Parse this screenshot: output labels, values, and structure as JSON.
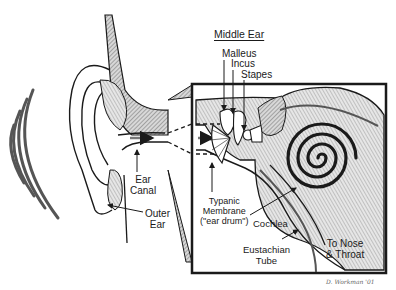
{
  "diagram": {
    "title": "Middle Ear",
    "labels": {
      "malleus": "Malleus",
      "incus": "Incus",
      "stapes": "Stapes",
      "ear_canal_1": "Ear",
      "ear_canal_2": "Canal",
      "outer_ear_1": "Outer",
      "outer_ear_2": "Ear",
      "typanic_1": "Typanic",
      "typanic_2": "Membrane",
      "typanic_3": "(\"ear drum\")",
      "cochlea": "Cochlea",
      "eustachian_1": "Eustachian",
      "eustachian_2": "Tube",
      "nose_1": "To Nose",
      "nose_2": "& Throat"
    },
    "signature": "D. Workman '01",
    "colors": {
      "ink": "#1a1a1a",
      "hatch": "#8a8a8a",
      "sound_waves": "#555555",
      "background": "#ffffff"
    }
  }
}
